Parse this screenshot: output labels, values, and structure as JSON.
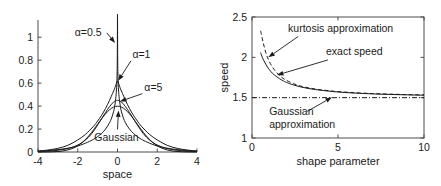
{
  "figure": {
    "title": "",
    "panels": [
      "generalized-gaussian-densities",
      "speed-vs-shape-parameter"
    ]
  },
  "chart_data": [
    {
      "id": "left",
      "type": "line",
      "title": "",
      "xlabel": "space",
      "ylabel": "",
      "xlim": [
        -4,
        4
      ],
      "ylim": [
        0,
        1.15
      ],
      "xticks": [
        -4,
        -2,
        0,
        2,
        4
      ],
      "xticklabels": [
        "-4",
        "-2",
        "0",
        "2",
        "4"
      ],
      "yticks": [
        0,
        0.2,
        0.4,
        0.6,
        0.8,
        1
      ],
      "yticklabels": [
        "0",
        "0.2",
        "0.4",
        "0.6",
        "0.8",
        "1"
      ],
      "grid": false,
      "legend": "none",
      "annotations": [
        {
          "name": "alpha-05-label",
          "text": "α=0.5",
          "x": -2.15,
          "y": 1.01,
          "arrow_to": [
            -0.12,
            0.95
          ]
        },
        {
          "name": "alpha-1-label",
          "text": "α=1",
          "x": 0.75,
          "y": 0.82,
          "arrow_to": [
            0.03,
            0.62
          ]
        },
        {
          "name": "alpha-5-label",
          "text": "α=5",
          "x": 1.35,
          "y": 0.53,
          "arrow_to": [
            0.12,
            0.44
          ]
        },
        {
          "name": "gaussian-label",
          "text": "Gaussian",
          "x": -0.05,
          "y": 0.1,
          "arrow_to": [
            0.0,
            0.38
          ]
        }
      ],
      "series": [
        {
          "name": "alpha=0.5",
          "style": "solid",
          "peak": 1.15,
          "x": [
            -4,
            -3.5,
            -3,
            -2.5,
            -2,
            -1.5,
            -1.2,
            -1,
            -0.8,
            -0.6,
            -0.4,
            -0.3,
            -0.2,
            -0.15,
            -0.1,
            -0.06,
            -0.03,
            -0.01,
            0,
            0.01,
            0.03,
            0.06,
            0.1,
            0.15,
            0.2,
            0.3,
            0.4,
            0.6,
            0.8,
            1,
            1.2,
            1.5,
            2,
            2.5,
            3,
            3.5,
            4
          ],
          "y": [
            0.008,
            0.013,
            0.021,
            0.033,
            0.052,
            0.085,
            0.111,
            0.134,
            0.162,
            0.2,
            0.255,
            0.295,
            0.35,
            0.39,
            0.45,
            0.52,
            0.62,
            0.82,
            1.2,
            0.82,
            0.62,
            0.52,
            0.45,
            0.39,
            0.35,
            0.295,
            0.255,
            0.2,
            0.162,
            0.134,
            0.111,
            0.085,
            0.052,
            0.033,
            0.021,
            0.013,
            0.008
          ]
        },
        {
          "name": "alpha=1",
          "style": "solid",
          "peak": 0.62,
          "x": [
            -4,
            -3.5,
            -3,
            -2.5,
            -2,
            -1.6,
            -1.2,
            -1,
            -0.8,
            -0.6,
            -0.4,
            -0.25,
            -0.15,
            -0.07,
            0,
            0.07,
            0.15,
            0.25,
            0.4,
            0.6,
            0.8,
            1,
            1.2,
            1.6,
            2,
            2.5,
            3,
            3.5,
            4
          ],
          "y": [
            0.009,
            0.017,
            0.032,
            0.058,
            0.105,
            0.155,
            0.225,
            0.27,
            0.32,
            0.38,
            0.45,
            0.51,
            0.55,
            0.59,
            0.62,
            0.59,
            0.55,
            0.51,
            0.45,
            0.38,
            0.32,
            0.27,
            0.225,
            0.155,
            0.105,
            0.058,
            0.032,
            0.017,
            0.009
          ]
        },
        {
          "name": "alpha=5",
          "style": "solid",
          "peak": 0.45,
          "x": [
            -4,
            -3.5,
            -3,
            -2.6,
            -2.2,
            -1.9,
            -1.6,
            -1.3,
            -1,
            -0.8,
            -0.6,
            -0.4,
            -0.2,
            0,
            0.2,
            0.4,
            0.6,
            0.8,
            1,
            1.3,
            1.6,
            1.9,
            2.2,
            2.6,
            3,
            3.5,
            4
          ],
          "y": [
            0.003,
            0.007,
            0.015,
            0.026,
            0.046,
            0.07,
            0.106,
            0.16,
            0.235,
            0.29,
            0.345,
            0.395,
            0.435,
            0.45,
            0.435,
            0.395,
            0.345,
            0.29,
            0.235,
            0.16,
            0.106,
            0.07,
            0.046,
            0.026,
            0.015,
            0.007,
            0.003
          ]
        },
        {
          "name": "Gaussian",
          "style": "solid",
          "peak": 0.399,
          "x": [
            -4,
            -3.5,
            -3,
            -2.6,
            -2.2,
            -1.9,
            -1.6,
            -1.3,
            -1,
            -0.8,
            -0.6,
            -0.4,
            -0.2,
            0,
            0.2,
            0.4,
            0.6,
            0.8,
            1,
            1.3,
            1.6,
            1.9,
            2.2,
            2.6,
            3,
            3.5,
            4
          ],
          "y": [
            0.0001,
            0.0009,
            0.0044,
            0.0136,
            0.0355,
            0.0656,
            0.1109,
            0.1714,
            0.242,
            0.2897,
            0.3332,
            0.3683,
            0.391,
            0.3989,
            0.391,
            0.3683,
            0.3332,
            0.2897,
            0.242,
            0.1714,
            0.1109,
            0.0656,
            0.0355,
            0.0136,
            0.0044,
            0.0009,
            0.0001
          ]
        }
      ]
    },
    {
      "id": "right",
      "type": "line",
      "title": "",
      "xlabel": "shape parameter",
      "ylabel": "speed",
      "xlim": [
        0,
        10
      ],
      "ylim": [
        1,
        2.5
      ],
      "xticks": [
        0,
        5,
        10
      ],
      "xticklabels": [
        "0",
        "5",
        "10"
      ],
      "yticks": [
        1,
        1.5,
        2,
        2.5
      ],
      "yticklabels": [
        "1",
        "1.5",
        "2",
        "2.5"
      ],
      "grid": false,
      "legend": "none",
      "annotations": [
        {
          "name": "kurtosis-approximation-label",
          "text": "kurtosis approximation",
          "x": 2.1,
          "y": 2.32,
          "arrow_to": [
            0.95,
            2.0
          ]
        },
        {
          "name": "exact-speed-label",
          "text": "exact speed",
          "x": 4.3,
          "y": 2.03,
          "arrow_to": [
            1.45,
            1.78
          ]
        },
        {
          "name": "gaussian-approximation-label",
          "text": "Gaussian approximation",
          "x": 1.0,
          "y": 1.28,
          "arrow_to": [
            4.65,
            1.505
          ]
        }
      ],
      "series": [
        {
          "name": "kurtosis approximation",
          "style": "dashed",
          "x": [
            0.5,
            0.6,
            0.7,
            0.8,
            0.9,
            1.0,
            1.2,
            1.4,
            1.6,
            1.8,
            2.0,
            2.4,
            2.8,
            3.2,
            3.6,
            4.0,
            4.6,
            5.2,
            6.0,
            7.0,
            8.0,
            9.0,
            10.0
          ],
          "y": [
            2.33,
            2.23,
            2.14,
            2.06,
            2.0,
            1.95,
            1.875,
            1.82,
            1.775,
            1.74,
            1.715,
            1.675,
            1.645,
            1.625,
            1.61,
            1.598,
            1.583,
            1.572,
            1.561,
            1.551,
            1.544,
            1.538,
            1.534
          ]
        },
        {
          "name": "exact speed",
          "style": "solid",
          "x": [
            0.5,
            0.6,
            0.7,
            0.8,
            0.9,
            1.0,
            1.2,
            1.4,
            1.6,
            1.8,
            2.0,
            2.4,
            2.8,
            3.2,
            3.6,
            4.0,
            4.6,
            5.2,
            6.0,
            7.0,
            8.0,
            9.0,
            10.0
          ],
          "y": [
            2.06,
            2.0,
            1.955,
            1.915,
            1.88,
            1.85,
            1.8,
            1.765,
            1.735,
            1.71,
            1.69,
            1.658,
            1.635,
            1.617,
            1.603,
            1.592,
            1.578,
            1.567,
            1.557,
            1.547,
            1.54,
            1.535,
            1.53
          ]
        },
        {
          "name": "Gaussian approximation",
          "style": "dashdot",
          "x": [
            0,
            10
          ],
          "y": [
            1.5,
            1.5
          ]
        }
      ]
    }
  ],
  "left_panel": {
    "xlabel": "space",
    "xticklabels": [
      "-4",
      "-2",
      "0",
      "2",
      "4"
    ],
    "yticklabels": [
      "0",
      "0.2",
      "0.4",
      "0.6",
      "0.8",
      "1"
    ],
    "annotations": {
      "alpha_half": "α=0.5",
      "alpha_one": "α=1",
      "alpha_five": "α=5",
      "gaussian": "Gaussian"
    }
  },
  "right_panel": {
    "xlabel": "shape parameter",
    "ylabel": "speed",
    "xticklabels": [
      "0",
      "5",
      "10"
    ],
    "yticklabels": [
      "1",
      "1.5",
      "2",
      "2.5"
    ],
    "annotations": {
      "kurtosis": "kurtosis approximation",
      "exact": "exact speed",
      "gaussian_line1": "Gaussian",
      "gaussian_line2": "approximation"
    }
  }
}
